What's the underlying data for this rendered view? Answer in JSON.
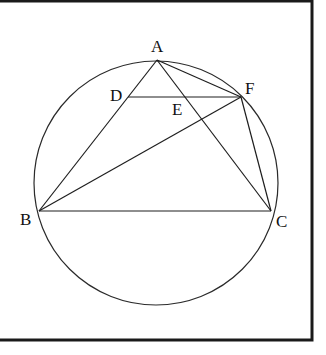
{
  "figure": {
    "frame": {
      "x": -2,
      "y": 1,
      "width": 314,
      "height": 339
    },
    "circle": {
      "cx": 156,
      "cy": 183,
      "r": 122
    },
    "points": {
      "A": {
        "label": "A",
        "x": 157,
        "y": 60
      },
      "B": {
        "label": "B",
        "x": 39,
        "y": 211
      },
      "C": {
        "label": "C",
        "x": 271,
        "y": 211
      },
      "D": {
        "label": "D",
        "x": 128,
        "y": 97
      },
      "E": {
        "label": "E",
        "x": 181,
        "y": 97
      },
      "F": {
        "label": "F",
        "x": 241,
        "y": 97
      }
    },
    "segments": [
      [
        "A",
        "B"
      ],
      [
        "A",
        "C"
      ],
      [
        "A",
        "F"
      ],
      [
        "B",
        "C"
      ],
      [
        "B",
        "F"
      ],
      [
        "D",
        "F"
      ],
      [
        "F",
        "C"
      ]
    ],
    "label_offsets": {
      "A": {
        "dx": -6,
        "dy": -8
      },
      "B": {
        "dx": -19,
        "dy": 14
      },
      "C": {
        "dx": 5,
        "dy": 16
      },
      "D": {
        "dx": -18,
        "dy": 4
      },
      "E": {
        "dx": -9,
        "dy": 18
      },
      "F": {
        "dx": 4,
        "dy": -3
      }
    }
  }
}
